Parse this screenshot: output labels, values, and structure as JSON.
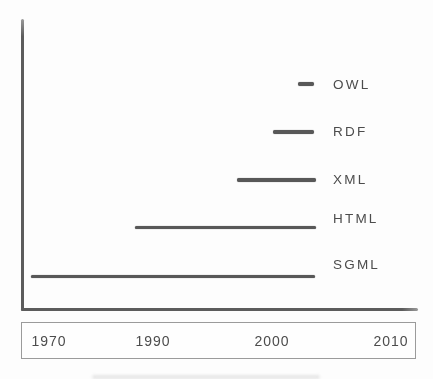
{
  "chart_data": {
    "type": "bar",
    "variant": "horizontal-timeline",
    "title": "",
    "xlabel": "",
    "ylabel": "",
    "grid": false,
    "legend": "none",
    "x_ticks": [
      "1970",
      "1990",
      "2000",
      "2010"
    ],
    "items": [
      {
        "label": "OWL",
        "start_year": 2002.2,
        "end_year": 2003.5
      },
      {
        "label": "RDF",
        "start_year": 2000.1,
        "end_year": 2003.5
      },
      {
        "label": "XML",
        "start_year": 1997.1,
        "end_year": 2003.7
      },
      {
        "label": "HTML",
        "start_year": 1986.5,
        "end_year": 2003.7
      },
      {
        "label": "SGML",
        "start_year": 1966.6,
        "end_year": 2003.6
      }
    ],
    "colors": {
      "bar": "#585858",
      "axis": "#5c5c5c",
      "text": "#4c4c4c",
      "box_border": "#9b9b9b",
      "background": "#fdfdfd"
    },
    "layout": {
      "year_to_x_anchors": [
        [
          1970,
          49
        ],
        [
          1990,
          153
        ],
        [
          2000,
          272
        ],
        [
          2010,
          391
        ]
      ],
      "bar_center_y": [
        84,
        132,
        180,
        227.5,
        276.5
      ],
      "label_center_y": [
        85,
        132,
        180,
        219,
        265
      ],
      "label_x": 333,
      "tick_center_y": 341
    }
  }
}
